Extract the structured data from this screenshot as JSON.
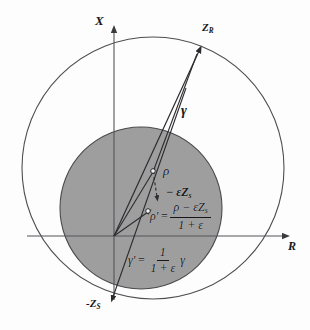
{
  "figure": {
    "kind": "geometric-diagram",
    "colors": {
      "background": "#fdfdfd",
      "ink": "#17171a",
      "line": "#3a3a3e",
      "inner_disk_fill": "#9e9e9e",
      "inner_disk_stroke": "#4a4a4e",
      "outer_circle_stroke": "#4e4e52",
      "axis": "#55555a"
    },
    "axes": {
      "vertical_label": "X",
      "horizontal_label": "R"
    },
    "labels": {
      "z_r": {
        "base": "Z",
        "sub": "R"
      },
      "z_s_negative": {
        "base": "-Z",
        "sub": "S"
      },
      "gamma": "γ",
      "rho": "ρ",
      "epsilon_zs": {
        "sign": "−",
        "base": "εZ",
        "sub": "s"
      },
      "rho_prime": {
        "lhs": "ρ'",
        "equals": "=",
        "numerator": {
          "rho": "ρ",
          "minus": "−",
          "eps_z": "εZ",
          "sub": "s"
        },
        "denominator": "1 + ε"
      },
      "gamma_prime": {
        "lhs": "γ'",
        "equals": "=",
        "numerator": "1",
        "denominator": "1 + ε",
        "trailing": "γ"
      }
    },
    "geometry": {
      "origin": {
        "x": 114,
        "y": 236
      },
      "outer_circle": {
        "cx": 153,
        "cy": 168,
        "r": 131
      },
      "inner_disk": {
        "cx": 141,
        "cy": 208,
        "r": 81
      },
      "point_zr": {
        "x": 199,
        "y": 51
      },
      "point_zs_neg": {
        "x": 113,
        "y": 297
      },
      "point_rho": {
        "x": 153,
        "y": 172
      },
      "point_rho_prime": {
        "x": 148,
        "y": 212
      },
      "dashed_arrow": {
        "x1": 154,
        "y1": 177,
        "x2": 157,
        "y2": 198
      }
    }
  }
}
